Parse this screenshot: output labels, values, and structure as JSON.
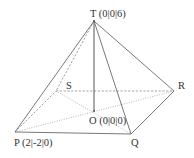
{
  "diagram": {
    "type": "square pyramid",
    "vertices": {
      "T": {
        "label": "T (0|0|6)",
        "x": 94,
        "y": 21
      },
      "P": {
        "label": "P (2|-2|0)",
        "x": 15,
        "y": 132
      },
      "Q": {
        "label": "Q",
        "x": 131,
        "y": 134
      },
      "R": {
        "label": "R",
        "x": 174,
        "y": 91
      },
      "S": {
        "label": "S",
        "x": 56,
        "y": 91
      },
      "O": {
        "label": "O (0|0|0)",
        "x": 94,
        "y": 111
      }
    },
    "edges_visible": [
      "TP",
      "TQ",
      "TR",
      "PQ",
      "QR"
    ],
    "edges_hidden": [
      "TS",
      "PS",
      "SR"
    ],
    "auxiliary_lines": [
      "TO",
      "PR",
      "SQ"
    ],
    "colors": {
      "line": "#6a6a6a",
      "hidden_line": "#8a8a8a",
      "text": "#333333"
    }
  }
}
